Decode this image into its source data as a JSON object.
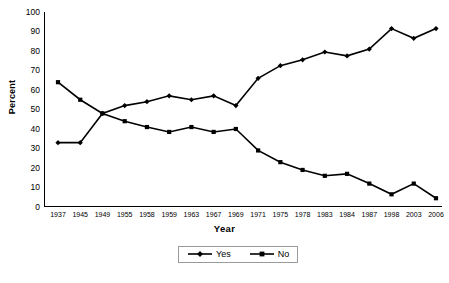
{
  "chart_data": {
    "type": "line",
    "title": "",
    "xlabel": "Year",
    "ylabel": "Percent",
    "categories": [
      "1937",
      "1945",
      "1949",
      "1955",
      "1958",
      "1959",
      "1963",
      "1967",
      "1969",
      "1971",
      "1975",
      "1978",
      "1983",
      "1984",
      "1987",
      "1998",
      "2003",
      "2006"
    ],
    "ylim": [
      0,
      100
    ],
    "ytick_step": 10,
    "yticks": [
      "100",
      "90",
      "80",
      "70",
      "60",
      "50",
      "40",
      "30",
      "20",
      "10",
      "0"
    ],
    "grid": false,
    "legend_position": "bottom",
    "series": [
      {
        "name": "Yes",
        "marker": "diamond",
        "color": "#000000",
        "values": [
          33,
          33,
          48,
          52,
          54,
          57,
          55,
          57,
          52,
          66,
          72.5,
          75.5,
          79.5,
          77.5,
          81,
          91.5,
          86.5,
          91.5
        ]
      },
      {
        "name": "No",
        "marker": "square",
        "color": "#000000",
        "values": [
          64,
          55,
          48,
          44,
          41,
          38.5,
          41,
          38.5,
          40,
          29,
          23,
          19,
          16,
          17,
          12,
          6.5,
          12,
          4.5
        ]
      }
    ]
  },
  "legend": {
    "items": [
      {
        "label": "Yes",
        "marker": "diamond"
      },
      {
        "label": "No",
        "marker": "square"
      }
    ]
  }
}
